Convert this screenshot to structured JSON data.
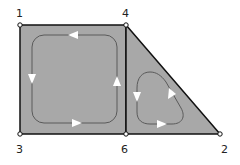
{
  "diagram": {
    "type": "mesh-loop-diagram",
    "colors": {
      "fill": "#a8a8a8",
      "edge": "#111111",
      "loop": "#5a5a5a",
      "arrow": "#ffffff",
      "node_fill": "#ffffff"
    },
    "nodes": [
      {
        "id": "1",
        "label": "1"
      },
      {
        "id": "4",
        "label": "4"
      },
      {
        "id": "3",
        "label": "3"
      },
      {
        "id": "6",
        "label": "6"
      },
      {
        "id": "2",
        "label": "2"
      }
    ],
    "regions": [
      {
        "id": "rectangle",
        "vertices": [
          "1",
          "4",
          "6",
          "3"
        ],
        "loop_direction": "counterclockwise"
      },
      {
        "id": "triangle",
        "vertices": [
          "4",
          "2",
          "6"
        ],
        "loop_direction": "counterclockwise"
      }
    ]
  }
}
